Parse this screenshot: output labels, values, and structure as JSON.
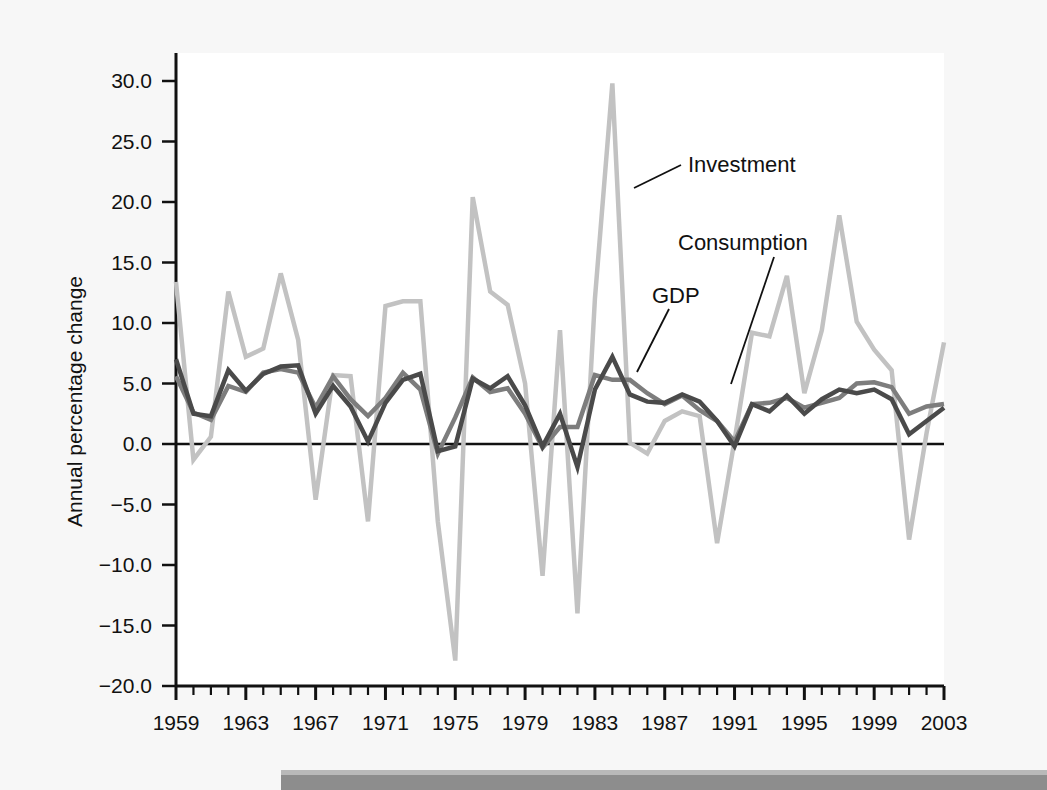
{
  "figure": {
    "ylabel": "Annual percentage change",
    "xlabel": "",
    "title": ""
  },
  "annotations": [
    {
      "name": "investment",
      "label": "Investment"
    },
    {
      "name": "consumption",
      "label": "Consumption"
    },
    {
      "name": "gdp",
      "label": "GDP"
    }
  ],
  "axes": {
    "y_ticks": [
      "30.0",
      "25.0",
      "20.0",
      "15.0",
      "10.0",
      "5.0",
      "0.0",
      "-5.0",
      "-10.0",
      "-15.0",
      "-20.0"
    ],
    "x_ticks": [
      "1959",
      "1963",
      "1967",
      "1971",
      "1975",
      "1979",
      "1983",
      "1987",
      "1991",
      "1995",
      "1999",
      "2003"
    ]
  },
  "colors": {
    "gdp": "#4a4a4a",
    "consumption": "#7d7d7d",
    "investment": "#c2c2c2",
    "axis": "#111111",
    "page_background": "#f7f7f7",
    "plot_background": "#ffffff"
  },
  "chart_data": {
    "type": "line",
    "title": "",
    "xlabel": "",
    "ylabel": "Annual percentage change",
    "xlim": [
      1959,
      2003
    ],
    "ylim": [
      -20.0,
      30.0
    ],
    "grid": false,
    "legend": "inline annotations with leader lines",
    "x": [
      1959,
      1960,
      1961,
      1962,
      1963,
      1964,
      1965,
      1966,
      1967,
      1968,
      1969,
      1970,
      1971,
      1972,
      1973,
      1974,
      1975,
      1976,
      1977,
      1978,
      1979,
      1980,
      1981,
      1982,
      1983,
      1984,
      1985,
      1986,
      1987,
      1988,
      1989,
      1990,
      1991,
      1992,
      1993,
      1994,
      1995,
      1996,
      1997,
      1998,
      1999,
      2000,
      2001,
      2002,
      2003
    ],
    "series": [
      {
        "name": "GDP",
        "color": "#4a4a4a",
        "values": [
          7.0,
          2.5,
          2.3,
          6.1,
          4.4,
          5.8,
          6.4,
          6.5,
          2.5,
          4.8,
          3.1,
          0.2,
          3.4,
          5.3,
          5.8,
          -0.6,
          -0.2,
          5.4,
          4.6,
          5.6,
          3.2,
          -0.2,
          2.5,
          -1.9,
          4.5,
          7.2,
          4.1,
          3.5,
          3.4,
          4.1,
          3.5,
          1.9,
          -0.2,
          3.3,
          2.7,
          4.0,
          2.5,
          3.7,
          4.5,
          4.2,
          4.5,
          3.7,
          0.8,
          1.9,
          3.0
        ]
      },
      {
        "name": "Consumption",
        "color": "#7d7d7d",
        "values": [
          5.6,
          2.6,
          2.0,
          4.8,
          4.3,
          5.9,
          6.2,
          5.9,
          3.0,
          5.6,
          3.7,
          2.3,
          3.8,
          5.9,
          4.5,
          -0.8,
          2.2,
          5.5,
          4.3,
          4.6,
          2.5,
          -0.3,
          1.4,
          1.4,
          5.7,
          5.3,
          5.3,
          4.2,
          3.3,
          4.0,
          2.8,
          1.9,
          0.2,
          3.3,
          3.4,
          3.8,
          3.0,
          3.4,
          3.8,
          5.0,
          5.1,
          4.7,
          2.5,
          3.1,
          3.3
        ]
      },
      {
        "name": "Investment",
        "color": "#c2c2c2",
        "values": [
          13.4,
          -1.3,
          0.6,
          12.6,
          7.2,
          7.9,
          14.1,
          8.6,
          -4.6,
          5.7,
          5.6,
          -6.4,
          11.4,
          11.8,
          11.8,
          -6.4,
          -17.9,
          20.4,
          12.6,
          11.5,
          5.0,
          -10.9,
          9.4,
          -14.0,
          12.0,
          29.8,
          0.1,
          -0.8,
          1.9,
          2.7,
          2.3,
          -8.2,
          0.3,
          9.2,
          8.9,
          13.9,
          4.2,
          9.4,
          18.9,
          10.1,
          7.8,
          6.1,
          -7.9,
          0.9,
          8.4
        ]
      }
    ]
  }
}
